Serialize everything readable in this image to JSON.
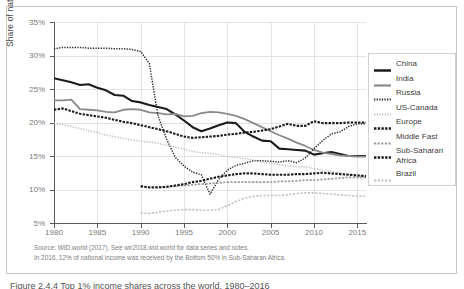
{
  "chart_data": {
    "type": "line",
    "title": "",
    "xlabel": "",
    "ylabel": "Share of national income (%)",
    "xlim": [
      1980,
      2016
    ],
    "ylim": [
      5,
      35
    ],
    "grid": true,
    "legend_position": "right",
    "y_ticks": [
      "5%",
      "10%",
      "15%",
      "20%",
      "25%",
      "30%",
      "35%"
    ],
    "y_tick_values": [
      5,
      10,
      15,
      20,
      25,
      30,
      35
    ],
    "x_ticks": [
      "1980",
      "1985",
      "1990",
      "1995",
      "2000",
      "2005",
      "2010",
      "2015"
    ],
    "x_tick_values": [
      1980,
      1985,
      1990,
      1995,
      2000,
      2005,
      2010,
      2015
    ],
    "series": [
      {
        "name": "China",
        "style": "solid-thick",
        "color": "#1a1a1a",
        "x": [
          1980,
          1981,
          1982,
          1983,
          1984,
          1985,
          1986,
          1987,
          1988,
          1989,
          1990,
          1991,
          1992,
          1993,
          1994,
          1995,
          1996,
          1997,
          1998,
          1999,
          2000,
          2001,
          2002,
          2003,
          2004,
          2005,
          2006,
          2007,
          2008,
          2009,
          2010,
          2011,
          2012,
          2013,
          2014,
          2015,
          2016
        ],
        "y": [
          26.6,
          26.3,
          26.0,
          25.6,
          25.7,
          25.2,
          24.8,
          24.1,
          24.0,
          23.2,
          23.0,
          22.6,
          22.3,
          22.0,
          21.2,
          20.3,
          19.3,
          18.7,
          19.1,
          19.6,
          20.0,
          19.9,
          18.6,
          17.9,
          17.3,
          17.2,
          16.1,
          16.0,
          15.9,
          15.8,
          15.2,
          15.4,
          15.6,
          15.3,
          15.0,
          15.0,
          15.0
        ]
      },
      {
        "name": "India",
        "style": "solid-gray",
        "color": "#8a8a8a",
        "x": [
          1980,
          1981,
          1982,
          1983,
          1984,
          1985,
          1986,
          1987,
          1988,
          1989,
          1990,
          1991,
          1992,
          1993,
          1994,
          1995,
          1996,
          1997,
          1998,
          1999,
          2000,
          2001,
          2002,
          2003,
          2004,
          2005,
          2006,
          2007,
          2008,
          2009,
          2010,
          2011,
          2012,
          2013,
          2014,
          2015,
          2016
        ],
        "y": [
          23.3,
          23.3,
          23.4,
          22.0,
          21.9,
          21.8,
          21.6,
          21.5,
          21.9,
          22.0,
          21.9,
          21.5,
          21.4,
          21.2,
          21.3,
          20.9,
          21.0,
          21.4,
          21.6,
          21.5,
          21.3,
          21.0,
          20.5,
          19.9,
          19.3,
          18.7,
          18.1,
          17.6,
          17.0,
          16.5,
          15.9,
          15.5,
          15.3,
          15.1,
          15.0,
          14.9,
          14.9
        ]
      },
      {
        "name": "Russia",
        "style": "dotted-fine",
        "color": "#2b2b2b",
        "x": [
          1980,
          1981,
          1982,
          1983,
          1984,
          1985,
          1986,
          1987,
          1988,
          1989,
          1990,
          1991,
          1992,
          1993,
          1994,
          1995,
          1996,
          1997,
          1998,
          1999,
          2000,
          2001,
          2002,
          2003,
          2004,
          2005,
          2006,
          2007,
          2008,
          2009,
          2010,
          2011,
          2012,
          2013,
          2014,
          2015,
          2016
        ],
        "y": [
          31.0,
          31.2,
          31.2,
          31.2,
          31.1,
          31.1,
          31.1,
          31.0,
          31.0,
          30.9,
          30.6,
          28.8,
          21.0,
          17.5,
          14.8,
          13.5,
          12.6,
          12.2,
          9.3,
          11.5,
          12.9,
          13.6,
          13.9,
          14.3,
          14.3,
          14.2,
          14.1,
          14.3,
          14.0,
          14.7,
          16.1,
          17.3,
          18.3,
          18.6,
          19.4,
          19.8,
          19.8
        ]
      },
      {
        "name": "US-Canada",
        "style": "dotted-light",
        "color": "#bdbdbd",
        "x": [
          1980,
          1981,
          1982,
          1983,
          1984,
          1985,
          1986,
          1987,
          1988,
          1989,
          1990,
          1991,
          1992,
          1993,
          1994,
          1995,
          1996,
          1997,
          1998,
          1999,
          2000,
          2001,
          2002,
          2003,
          2004,
          2005,
          2006,
          2007,
          2008,
          2009,
          2010,
          2011,
          2012,
          2013,
          2014,
          2015,
          2016
        ],
        "y": [
          19.9,
          19.7,
          19.4,
          19.1,
          18.8,
          18.5,
          18.1,
          17.9,
          17.6,
          17.4,
          17.2,
          17.1,
          16.9,
          16.6,
          16.3,
          16.0,
          15.7,
          15.5,
          15.4,
          15.2,
          14.9,
          14.8,
          14.6,
          14.4,
          14.1,
          13.9,
          13.7,
          13.5,
          13.4,
          13.4,
          13.1,
          12.9,
          12.7,
          12.5,
          12.3,
          12.1,
          12.0
        ]
      },
      {
        "name": "Europe",
        "style": "dashed-bold",
        "color": "#1a1a1a",
        "x": [
          1980,
          1981,
          1982,
          1983,
          1984,
          1985,
          1986,
          1987,
          1988,
          1989,
          1990,
          1991,
          1992,
          1993,
          1994,
          1995,
          1996,
          1997,
          1998,
          1999,
          2000,
          2001,
          2002,
          2003,
          2004,
          2005,
          2006,
          2007,
          2008,
          2009,
          2010,
          2011,
          2012,
          2013,
          2014,
          2015,
          2016
        ],
        "y": [
          21.9,
          22.1,
          21.7,
          21.3,
          21.1,
          20.9,
          20.7,
          20.4,
          20.1,
          19.9,
          19.6,
          19.3,
          19.0,
          18.7,
          18.3,
          17.9,
          17.7,
          17.8,
          17.9,
          18.0,
          18.2,
          18.3,
          18.5,
          18.6,
          18.8,
          19.0,
          19.4,
          19.8,
          19.5,
          19.5,
          20.2,
          19.9,
          19.9,
          19.9,
          20.0,
          20.0,
          20.0
        ]
      },
      {
        "name": "Middle Fast",
        "style": "dashed-gray",
        "color": "#9a9a9a",
        "x": [
          1990,
          1991,
          1992,
          1993,
          1994,
          1995,
          1996,
          1997,
          1998,
          1999,
          2000,
          2001,
          2002,
          2003,
          2004,
          2005,
          2006,
          2007,
          2008,
          2009,
          2010,
          2011,
          2012,
          2013,
          2014,
          2015,
          2016
        ],
        "y": [
          10.4,
          10.4,
          10.4,
          10.4,
          10.5,
          10.6,
          10.7,
          10.8,
          10.9,
          11.0,
          11.1,
          11.1,
          11.1,
          11.1,
          11.1,
          11.1,
          11.2,
          11.2,
          11.3,
          11.4,
          11.4,
          11.5,
          11.6,
          11.7,
          11.8,
          11.8,
          11.8
        ]
      },
      {
        "name": "Sub-Saharan Africa",
        "style": "dashed-bold",
        "color": "#1a1a1a",
        "x": [
          1990,
          1991,
          1992,
          1993,
          1994,
          1995,
          1996,
          1997,
          1998,
          1999,
          2000,
          2001,
          2002,
          2003,
          2004,
          2005,
          2006,
          2007,
          2008,
          2009,
          2010,
          2011,
          2012,
          2013,
          2014,
          2015,
          2016
        ],
        "y": [
          10.5,
          10.3,
          10.3,
          10.4,
          10.6,
          10.8,
          11.1,
          11.3,
          11.6,
          11.9,
          12.1,
          12.3,
          12.4,
          12.4,
          12.3,
          12.2,
          12.2,
          12.2,
          12.3,
          12.3,
          12.4,
          12.5,
          12.4,
          12.3,
          12.2,
          12.1,
          12.0
        ]
      },
      {
        "name": "Brazil",
        "style": "dashed-light",
        "color": "#c2c2c2",
        "x": [
          1990,
          1991,
          1992,
          1993,
          1994,
          1995,
          1996,
          1997,
          1998,
          1999,
          2000,
          2001,
          2002,
          2003,
          2004,
          2005,
          2006,
          2007,
          2008,
          2009,
          2010,
          2011,
          2012,
          2013,
          2014,
          2015,
          2016
        ],
        "y": [
          6.5,
          6.4,
          6.6,
          6.8,
          6.9,
          7.0,
          7.0,
          6.9,
          6.9,
          7.0,
          7.6,
          8.2,
          8.7,
          9.0,
          9.1,
          9.1,
          9.1,
          9.2,
          9.4,
          9.5,
          9.5,
          9.4,
          9.3,
          9.2,
          9.1,
          9.0,
          9.0
        ]
      }
    ]
  },
  "legend": {
    "items": [
      {
        "label": "China",
        "marker": "solid-thick"
      },
      {
        "label": "India",
        "marker": "solid-gray"
      },
      {
        "label": "Russia",
        "marker": "dotted-fine"
      },
      {
        "label": "US-Canada",
        "marker": "dotted-light"
      },
      {
        "label": "Europe",
        "marker": "dashed-bold"
      },
      {
        "label": "Middle Fast",
        "marker": "dashed-gray"
      },
      {
        "label": "Sub-Saharan Africa",
        "marker": "dashed-bold"
      },
      {
        "label": "Brazil",
        "marker": "dashed-light"
      }
    ]
  },
  "notes": {
    "source": "Source: WID.world (2017). See wir2018.wid.world for data series and notes.",
    "detail": "In 2016, 12% of national income was received by the Bottom 50% in Sub-Saharan Africa."
  },
  "caption": {
    "text": "Figure 2.4.4 Top 1% income shares across the world, 1980–2016"
  },
  "colors": {
    "axis": "#595959",
    "grid": "#e3e3e3",
    "tick_text": "#7a7a7a",
    "frame": "#c9c9c9"
  }
}
